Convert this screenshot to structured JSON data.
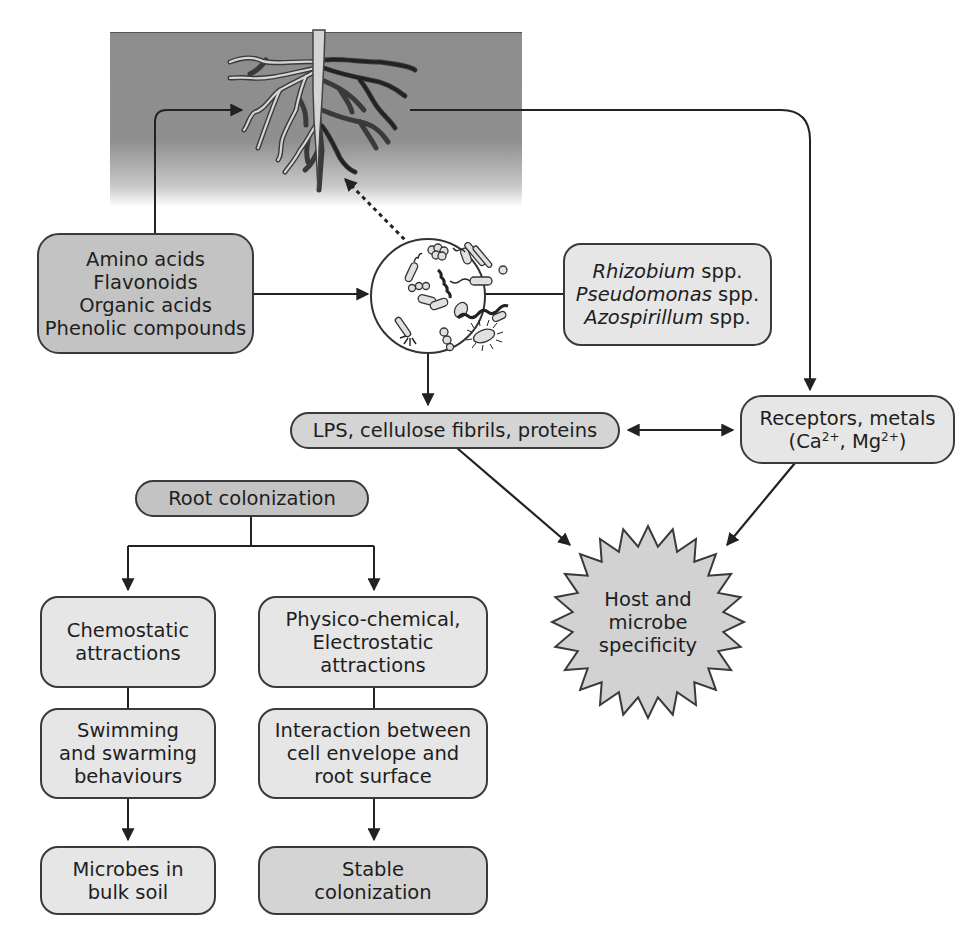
{
  "diagram": {
    "colors": {
      "soil": "#8f8f8f",
      "box_dark": "#c3c3c3",
      "box_mid": "#d4d4d4",
      "box_light": "#e6e6e6",
      "line": "#2a2a2a"
    },
    "nodes": {
      "root_in_soil": {
        "label": "Plant root system in soil",
        "icon": "plant-root-icon"
      },
      "exudates": {
        "lines": [
          "Amino acids",
          "Flavonoids",
          "Organic acids",
          "Phenolic compounds"
        ]
      },
      "microbes": {
        "label": "Soil microbes",
        "icon": "microbe-community-icon"
      },
      "species": {
        "items": [
          {
            "genus": "Rhizobium",
            "suffix": " spp."
          },
          {
            "genus": "Pseudomonas",
            "suffix": " spp."
          },
          {
            "genus": "Azospirillum",
            "suffix": " spp."
          }
        ]
      },
      "surface_molecules": {
        "label": "LPS, cellulose fibrils, proteins"
      },
      "receptors": {
        "line1": "Receptors, metals",
        "line2_open": "(Ca",
        "line2_sup1": "2+",
        "line2_mid": ", Mg",
        "line2_sup2": "2+",
        "line2_close": ")"
      },
      "specificity": {
        "lines": [
          "Host and",
          "microbe",
          "specificity"
        ]
      },
      "root_colonization": {
        "label": "Root colonization"
      },
      "left_branch": [
        {
          "lines": [
            "Chemostatic",
            "attractions"
          ]
        },
        {
          "lines": [
            "Swimming",
            "and swarming",
            "behaviours"
          ]
        },
        {
          "lines": [
            "Microbes in",
            "bulk soil"
          ]
        }
      ],
      "right_branch": [
        {
          "lines": [
            "Physico-chemical,",
            "Electrostatic",
            "attractions"
          ]
        },
        {
          "lines": [
            "Interaction between",
            "cell envelope and",
            "root surface"
          ]
        },
        {
          "lines": [
            "Stable",
            "colonization"
          ]
        }
      ]
    },
    "edges": [
      {
        "from": "exudates",
        "to": "root_in_soil",
        "style": "solid-arrow"
      },
      {
        "from": "microbes",
        "to": "root_in_soil",
        "style": "dotted-arrow"
      },
      {
        "from": "exudates",
        "to": "microbes",
        "style": "solid-arrow"
      },
      {
        "from": "microbes",
        "to": "species",
        "style": "solid-line"
      },
      {
        "from": "microbes",
        "to": "surface_molecules",
        "style": "solid-arrow"
      },
      {
        "from": "root_in_soil",
        "to": "receptors",
        "style": "solid-arrow"
      },
      {
        "from": "surface_molecules",
        "to": "receptors",
        "style": "double-arrow"
      },
      {
        "from": "surface_molecules",
        "to": "specificity",
        "style": "solid-arrow"
      },
      {
        "from": "receptors",
        "to": "specificity",
        "style": "solid-arrow"
      },
      {
        "from": "root_colonization",
        "to": "left_branch.0",
        "style": "solid-arrow"
      },
      {
        "from": "root_colonization",
        "to": "right_branch.0",
        "style": "solid-arrow"
      },
      {
        "from": "left_branch.0",
        "to": "left_branch.1",
        "style": "solid-line"
      },
      {
        "from": "left_branch.1",
        "to": "left_branch.2",
        "style": "solid-arrow"
      },
      {
        "from": "right_branch.0",
        "to": "right_branch.1",
        "style": "solid-line"
      },
      {
        "from": "right_branch.1",
        "to": "right_branch.2",
        "style": "solid-arrow"
      }
    ]
  }
}
